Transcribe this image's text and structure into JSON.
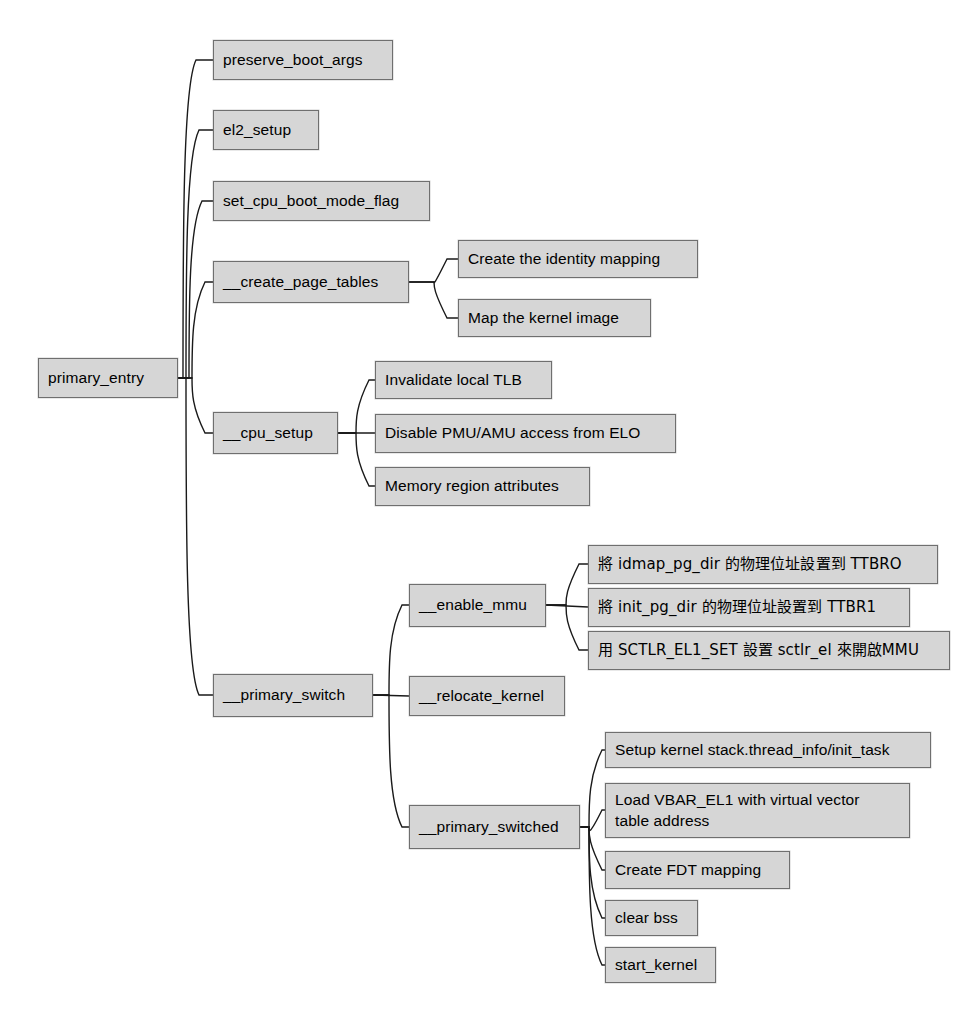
{
  "diagram": {
    "type": "mindmap-tree",
    "title": "primary_entry",
    "orientation": "left-to-right",
    "background_color": "#ffffff",
    "node_fill_color": "#d6d6d6",
    "node_border_color": "#6f6f6f",
    "edge_color": "#1a1a1a",
    "text_color": "#000000"
  },
  "nodes": [
    {
      "id": "primary_entry",
      "label": "primary_entry",
      "x": 38,
      "y": 358,
      "w": 140,
      "h": 40,
      "level": 0,
      "parent": null
    },
    {
      "id": "preserve_boot_args",
      "label": "preserve_boot_args",
      "x": 213,
      "y": 40,
      "w": 180,
      "h": 40,
      "level": 1,
      "parent": "primary_entry"
    },
    {
      "id": "el2_setup",
      "label": "el2_setup",
      "x": 213,
      "y": 110,
      "w": 106,
      "h": 40,
      "level": 1,
      "parent": "primary_entry"
    },
    {
      "id": "set_cpu_boot_mode_flag",
      "label": "set_cpu_boot_mode_flag",
      "x": 213,
      "y": 181,
      "w": 217,
      "h": 40,
      "level": 1,
      "parent": "primary_entry"
    },
    {
      "id": "create_page_tables",
      "label": "__create_page_tables",
      "x": 213,
      "y": 261,
      "w": 196,
      "h": 42,
      "level": 1,
      "parent": "primary_entry"
    },
    {
      "id": "create_identity_mapping",
      "label": "Create the identity mapping",
      "x": 458,
      "y": 240,
      "w": 240,
      "h": 38,
      "level": 2,
      "parent": "create_page_tables"
    },
    {
      "id": "map_kernel_image",
      "label": "Map the kernel image",
      "x": 458,
      "y": 299,
      "w": 193,
      "h": 38,
      "level": 2,
      "parent": "create_page_tables"
    },
    {
      "id": "cpu_setup",
      "label": "__cpu_setup",
      "x": 213,
      "y": 412,
      "w": 125,
      "h": 42,
      "level": 1,
      "parent": "primary_entry"
    },
    {
      "id": "invalidate_local_tlb",
      "label": "Invalidate local TLB",
      "x": 375,
      "y": 361,
      "w": 177,
      "h": 38,
      "level": 2,
      "parent": "cpu_setup"
    },
    {
      "id": "disable_pmu_amu",
      "label": "Disable PMU/AMU access from ELO",
      "x": 375,
      "y": 414,
      "w": 301,
      "h": 39,
      "level": 2,
      "parent": "cpu_setup"
    },
    {
      "id": "memory_region_attributes",
      "label": "Memory region attributes",
      "x": 375,
      "y": 467,
      "w": 215,
      "h": 39,
      "level": 2,
      "parent": "cpu_setup"
    },
    {
      "id": "primary_switch",
      "label": "__primary_switch",
      "x": 213,
      "y": 674,
      "w": 160,
      "h": 43,
      "level": 1,
      "parent": "primary_entry"
    },
    {
      "id": "enable_mmu",
      "label": "__enable_mmu",
      "x": 409,
      "y": 584,
      "w": 137,
      "h": 43,
      "level": 2,
      "parent": "primary_switch"
    },
    {
      "id": "ttbr0_set",
      "label": "將 idmap_pg_dir 的物理位址設置到 TTBRO",
      "x": 588,
      "y": 545,
      "w": 350,
      "h": 39,
      "level": 3,
      "parent": "enable_mmu",
      "script": "cjk"
    },
    {
      "id": "ttbr1_set",
      "label": "將 init_pg_dir 的物理位址設置到 TTBR1",
      "x": 588,
      "y": 588,
      "w": 322,
      "h": 39,
      "level": 3,
      "parent": "enable_mmu",
      "script": "cjk"
    },
    {
      "id": "sctlr_enable_mmu",
      "label": "用 SCTLR_EL1_SET 設置 sctlr_el 來開啟MMU",
      "x": 588,
      "y": 631,
      "w": 362,
      "h": 39,
      "level": 3,
      "parent": "enable_mmu",
      "script": "cjk"
    },
    {
      "id": "relocate_kernel",
      "label": "__relocate_kernel",
      "x": 409,
      "y": 676,
      "w": 156,
      "h": 40,
      "level": 2,
      "parent": "primary_switch"
    },
    {
      "id": "primary_switched",
      "label": "__primary_switched",
      "x": 409,
      "y": 805,
      "w": 171,
      "h": 44,
      "level": 2,
      "parent": "primary_switch"
    },
    {
      "id": "setup_kernel_stack",
      "label": "Setup kernel stack.thread_info/init_task",
      "x": 605,
      "y": 732,
      "w": 326,
      "h": 36,
      "level": 3,
      "parent": "primary_switched"
    },
    {
      "id": "load_vbar_el1",
      "label": "Load VBAR_EL1 with virtual vector\ntable address",
      "x": 605,
      "y": 783,
      "w": 305,
      "h": 55,
      "level": 3,
      "parent": "primary_switched",
      "lines": 2
    },
    {
      "id": "create_fdt_mapping",
      "label": "Create FDT mapping",
      "x": 605,
      "y": 851,
      "w": 185,
      "h": 38,
      "level": 3,
      "parent": "primary_switched"
    },
    {
      "id": "clear_bss",
      "label": "clear bss",
      "x": 605,
      "y": 900,
      "w": 93,
      "h": 36,
      "level": 3,
      "parent": "primary_switched"
    },
    {
      "id": "start_kernel",
      "label": "start_kernel",
      "x": 605,
      "y": 947,
      "w": 111,
      "h": 36,
      "level": 3,
      "parent": "primary_switched"
    }
  ],
  "edges": [
    {
      "id": "e-root-preserve",
      "from": "primary_entry",
      "to": "preserve_boot_args",
      "trunk_x": 183,
      "from_x": 178,
      "from_y": 378,
      "to_x": 213,
      "to_y": 60
    },
    {
      "id": "e-root-el2",
      "from": "primary_entry",
      "to": "el2_setup",
      "trunk_x": 186,
      "from_x": 178,
      "from_y": 378,
      "to_x": 213,
      "to_y": 130
    },
    {
      "id": "e-root-setcpu",
      "from": "primary_entry",
      "to": "set_cpu_boot_mode_flag",
      "trunk_x": 189,
      "from_x": 178,
      "from_y": 378,
      "to_x": 213,
      "to_y": 201
    },
    {
      "id": "e-root-cpt",
      "from": "primary_entry",
      "to": "create_page_tables",
      "trunk_x": 192,
      "from_x": 178,
      "from_y": 378,
      "to_x": 213,
      "to_y": 282
    },
    {
      "id": "e-root-cpusetup",
      "from": "primary_entry",
      "to": "cpu_setup",
      "trunk_x": 192,
      "from_x": 178,
      "from_y": 378,
      "to_x": 213,
      "to_y": 433
    },
    {
      "id": "e-root-pswitch",
      "from": "primary_entry",
      "to": "primary_switch",
      "trunk_x": 186,
      "from_x": 178,
      "from_y": 378,
      "to_x": 213,
      "to_y": 695
    },
    {
      "id": "e-cpt-identity",
      "from": "create_page_tables",
      "to": "create_identity_mapping",
      "trunk_x": 434,
      "from_x": 409,
      "from_y": 282,
      "to_x": 458,
      "to_y": 259
    },
    {
      "id": "e-cpt-mapkernel",
      "from": "create_page_tables",
      "to": "map_kernel_image",
      "trunk_x": 434,
      "from_x": 409,
      "from_y": 282,
      "to_x": 458,
      "to_y": 318
    },
    {
      "id": "e-cpu-tlb",
      "from": "cpu_setup",
      "to": "invalidate_local_tlb",
      "trunk_x": 356,
      "from_x": 338,
      "from_y": 433,
      "to_x": 375,
      "to_y": 380
    },
    {
      "id": "e-cpu-pmu",
      "from": "cpu_setup",
      "to": "disable_pmu_amu",
      "trunk_x": 356,
      "from_x": 338,
      "from_y": 433,
      "to_x": 375,
      "to_y": 433
    },
    {
      "id": "e-cpu-memattr",
      "from": "cpu_setup",
      "to": "memory_region_attributes",
      "trunk_x": 356,
      "from_x": 338,
      "from_y": 433,
      "to_x": 375,
      "to_y": 486
    },
    {
      "id": "e-psw-mmu",
      "from": "primary_switch",
      "to": "enable_mmu",
      "trunk_x": 389,
      "from_x": 373,
      "from_y": 695,
      "to_x": 409,
      "to_y": 605
    },
    {
      "id": "e-psw-reloc",
      "from": "primary_switch",
      "to": "relocate_kernel",
      "trunk_x": 389,
      "from_x": 373,
      "from_y": 695,
      "to_x": 409,
      "to_y": 696
    },
    {
      "id": "e-psw-switched",
      "from": "primary_switch",
      "to": "primary_switched",
      "trunk_x": 389,
      "from_x": 373,
      "from_y": 695,
      "to_x": 409,
      "to_y": 827
    },
    {
      "id": "e-mmu-ttbr0",
      "from": "enable_mmu",
      "to": "ttbr0_set",
      "trunk_x": 566,
      "from_x": 546,
      "from_y": 605,
      "to_x": 588,
      "to_y": 564
    },
    {
      "id": "e-mmu-ttbr1",
      "from": "enable_mmu",
      "to": "ttbr1_set",
      "trunk_x": 566,
      "from_x": 546,
      "from_y": 605,
      "to_x": 588,
      "to_y": 607
    },
    {
      "id": "e-mmu-sctlr",
      "from": "enable_mmu",
      "to": "sctlr_enable_mmu",
      "trunk_x": 566,
      "from_x": 546,
      "from_y": 605,
      "to_x": 588,
      "to_y": 650
    },
    {
      "id": "e-sw-stack",
      "from": "primary_switched",
      "to": "setup_kernel_stack",
      "trunk_x": 589,
      "from_x": 580,
      "from_y": 827,
      "to_x": 605,
      "to_y": 750
    },
    {
      "id": "e-sw-vbar",
      "from": "primary_switched",
      "to": "load_vbar_el1",
      "trunk_x": 589,
      "from_x": 580,
      "from_y": 827,
      "to_x": 605,
      "to_y": 810
    },
    {
      "id": "e-sw-fdt",
      "from": "primary_switched",
      "to": "create_fdt_mapping",
      "trunk_x": 589,
      "from_x": 580,
      "from_y": 827,
      "to_x": 605,
      "to_y": 870
    },
    {
      "id": "e-sw-bss",
      "from": "primary_switched",
      "to": "clear_bss",
      "trunk_x": 589,
      "from_x": 580,
      "from_y": 827,
      "to_x": 605,
      "to_y": 918
    },
    {
      "id": "e-sw-startkernel",
      "from": "primary_switched",
      "to": "start_kernel",
      "trunk_x": 589,
      "from_x": 580,
      "from_y": 827,
      "to_x": 605,
      "to_y": 965
    }
  ]
}
